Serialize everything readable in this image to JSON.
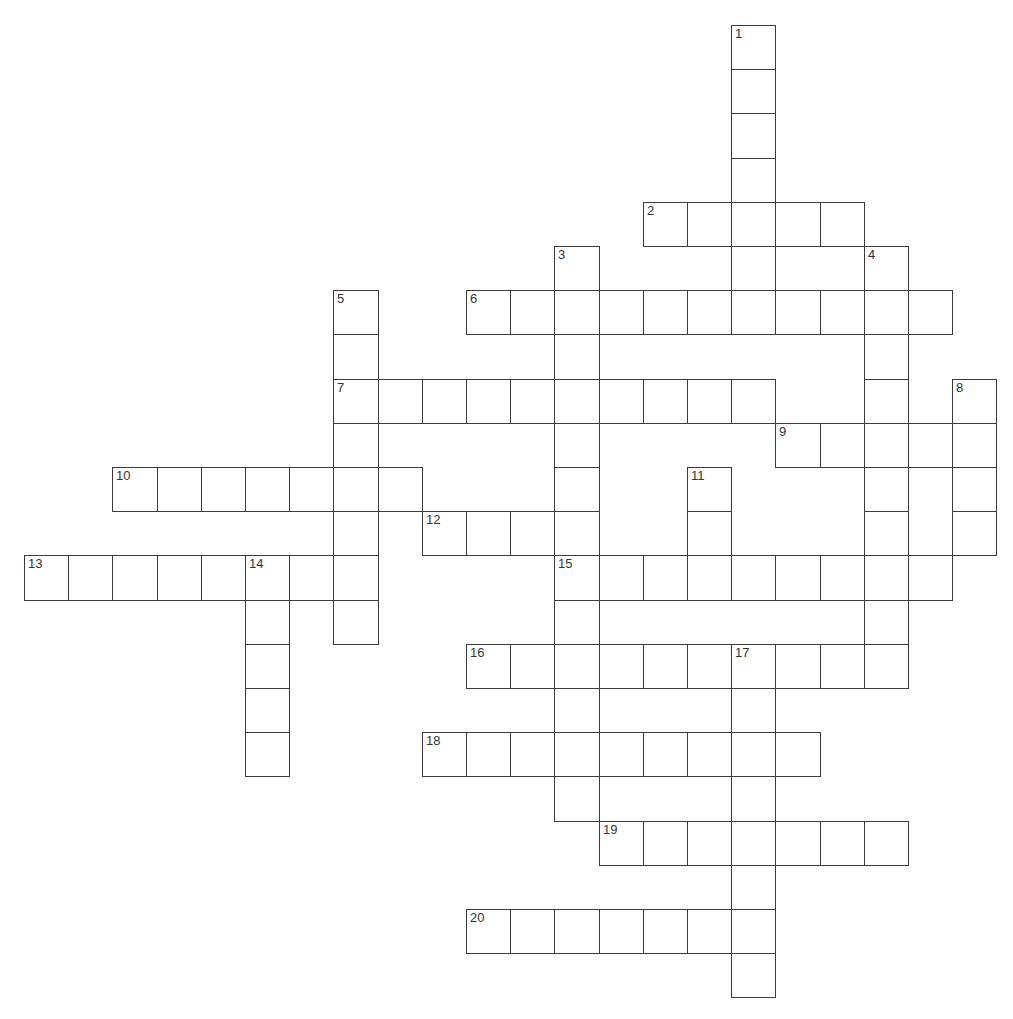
{
  "puzzle": {
    "type": "crossword",
    "cell_size": 44.2,
    "origin": {
      "x": 24,
      "y": 25
    },
    "line_color": "#3a3a3a",
    "background": "#ffffff",
    "entries": [
      {
        "number": "1",
        "direction": "down",
        "row": 0,
        "col": 16,
        "length": 6
      },
      {
        "number": "2",
        "direction": "across",
        "row": 4,
        "col": 14,
        "length": 5
      },
      {
        "number": "3",
        "direction": "down",
        "row": 5,
        "col": 12,
        "length": 13
      },
      {
        "number": "4",
        "direction": "down",
        "row": 5,
        "col": 19,
        "length": 10
      },
      {
        "number": "5",
        "direction": "down",
        "row": 6,
        "col": 7,
        "length": 8
      },
      {
        "number": "6",
        "direction": "across",
        "row": 6,
        "col": 10,
        "length": 11
      },
      {
        "number": "7",
        "direction": "across",
        "row": 8,
        "col": 7,
        "length": 10
      },
      {
        "number": "8",
        "direction": "down",
        "row": 8,
        "col": 21,
        "length": 4
      },
      {
        "number": "9",
        "direction": "across",
        "row": 9,
        "col": 17,
        "length": 5
      },
      {
        "number": "10",
        "direction": "across",
        "row": 10,
        "col": 2,
        "length": 7
      },
      {
        "number": "11",
        "direction": "down",
        "row": 10,
        "col": 15,
        "length": 3
      },
      {
        "number": "12",
        "direction": "across",
        "row": 11,
        "col": 9,
        "length": 4
      },
      {
        "number": "13",
        "direction": "across",
        "row": 12,
        "col": 0,
        "length": 8
      },
      {
        "number": "14",
        "direction": "down",
        "row": 12,
        "col": 5,
        "length": 5
      },
      {
        "number": "15",
        "direction": "across",
        "row": 12,
        "col": 12,
        "length": 9
      },
      {
        "number": "16",
        "direction": "across",
        "row": 14,
        "col": 10,
        "length": 10
      },
      {
        "number": "17",
        "direction": "down",
        "row": 14,
        "col": 16,
        "length": 8
      },
      {
        "number": "18",
        "direction": "across",
        "row": 16,
        "col": 9,
        "length": 9
      },
      {
        "number": "19",
        "direction": "across",
        "row": 18,
        "col": 13,
        "length": 7
      },
      {
        "number": "20",
        "direction": "across",
        "row": 20,
        "col": 10,
        "length": 7
      }
    ]
  }
}
